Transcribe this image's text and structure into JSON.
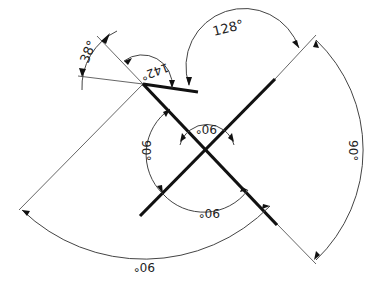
{
  "drawing": {
    "type": "CAD angular dimensioning drawing",
    "colors": {
      "background": "#ffffff",
      "geometry": "#111111",
      "dimension": "#444444"
    },
    "dimensions": [
      {
        "id": "dim-38",
        "label": "38°",
        "value_deg": 38
      },
      {
        "id": "dim-142",
        "label": "142°",
        "value_deg": 142
      },
      {
        "id": "dim-128",
        "label": "128°",
        "value_deg": 128
      },
      {
        "id": "dim-90-top-inner",
        "label": "90°",
        "value_deg": 90
      },
      {
        "id": "dim-90-left-inner",
        "label": "90°",
        "value_deg": 90
      },
      {
        "id": "dim-90-bottom-inner",
        "label": "90°",
        "value_deg": 90
      },
      {
        "id": "dim-90-right-outer",
        "label": "90°",
        "value_deg": 90
      },
      {
        "id": "dim-90-bottom-outer",
        "label": "90°",
        "value_deg": 90
      }
    ]
  }
}
